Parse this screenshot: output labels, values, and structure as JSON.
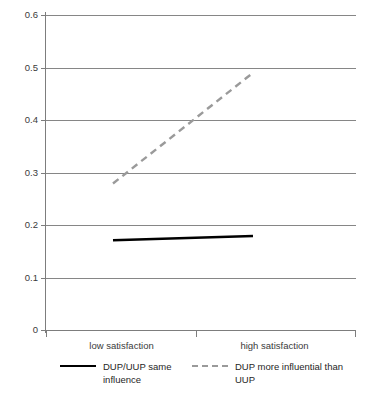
{
  "chart_data": {
    "type": "line",
    "title": "",
    "subtitle": "",
    "xlabel": "",
    "ylabel": "",
    "categories": [
      "low satisfaction",
      "high satisfaction"
    ],
    "x": [
      0,
      1
    ],
    "xlim": [
      0,
      1
    ],
    "ylim": [
      0,
      0.6
    ],
    "yticks": [
      0,
      0.1,
      0.2,
      0.3,
      0.4,
      0.5,
      0.6
    ],
    "ytick_labels": [
      "0",
      "0.1",
      "0.2",
      "0.3",
      "0.4",
      "0.5",
      "0.6"
    ],
    "grid": "horizontal",
    "legend_position": "bottom",
    "series": [
      {
        "name": "DUP/UUP same influence",
        "style": "solid",
        "color": "#000000",
        "values": [
          0.171,
          0.179
        ]
      },
      {
        "name": "DUP more influential than UUP",
        "style": "dashed",
        "color": "#9a9a9a",
        "values": [
          0.279,
          0.49
        ]
      }
    ],
    "annotations": []
  },
  "axes": {
    "y": {
      "ticks": [
        {
          "label": "0.6",
          "value": 0.6
        },
        {
          "label": "0.5",
          "value": 0.5
        },
        {
          "label": "0.4",
          "value": 0.4
        },
        {
          "label": "0.3",
          "value": 0.3
        },
        {
          "label": "0.2",
          "value": 0.2
        },
        {
          "label": "0.1",
          "value": 0.1
        },
        {
          "label": "0",
          "value": 0
        }
      ]
    },
    "x": {
      "ticks": [
        {
          "label": "low satisfaction",
          "value": 0
        },
        {
          "label": "high satisfaction",
          "value": 1
        }
      ]
    }
  },
  "legend": {
    "entries": [
      {
        "label": "DUP/UUP same influence",
        "style": "solid",
        "color": "#000000"
      },
      {
        "label": "DUP more influential than UUP",
        "style": "dashed",
        "color": "#9a9a9a"
      }
    ]
  },
  "colors": {
    "background": "#ffffff",
    "gridline": "#868686",
    "axis": "#7d7d7d",
    "tick_text": "#3a3a3a",
    "series_solid": "#000000",
    "series_dashed": "#9a9a9a"
  }
}
